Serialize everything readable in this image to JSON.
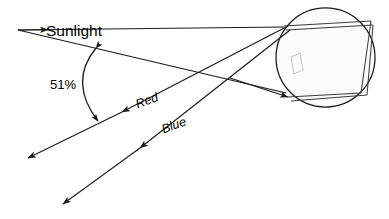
{
  "diagram": {
    "labels": {
      "sunlight": "Sunlight",
      "angle": "51%",
      "red": "Red",
      "blue": "Blue"
    },
    "colors": {
      "line": "#1a1a1a",
      "internal_ray": "#3b3b3b",
      "drop_fill": "#fbfbfb",
      "background": "#ffffff",
      "artifact_stroke": "#c8c8c8"
    },
    "elements": {
      "raindrop": "raindrop-circle",
      "incoming_ray": "sunlight-incoming-ray",
      "red_ray": "red-exit-ray",
      "blue_ray": "blue-exit-ray",
      "angle_arc": "angle-arc-51",
      "artifact": "internal-parallelogram-artifact"
    }
  }
}
